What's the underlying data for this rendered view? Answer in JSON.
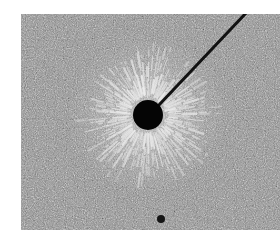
{
  "image": {
    "alt": "Electric field lines around a charged sphere shown by particles aligning radially",
    "photo_bounds": {
      "left": 21,
      "top": 14,
      "width": 259,
      "height": 216
    },
    "background_color": "#ffffff",
    "texture_color": "#8c8c8c",
    "sphere": {
      "cx": 127,
      "cy": 101,
      "r": 15,
      "color": "#050505"
    },
    "wire": {
      "x1": 138,
      "y1": 91,
      "x2": 226,
      "y2": -2,
      "width": 3,
      "color": "#111111"
    },
    "small_dot": {
      "cx": 140,
      "cy": 205,
      "r": 4,
      "color": "#151515"
    },
    "radial_streaks": {
      "count": 110,
      "inner_r": 17,
      "outer_r_min": 40,
      "outer_r_max": 75,
      "color": "#ececec"
    }
  }
}
